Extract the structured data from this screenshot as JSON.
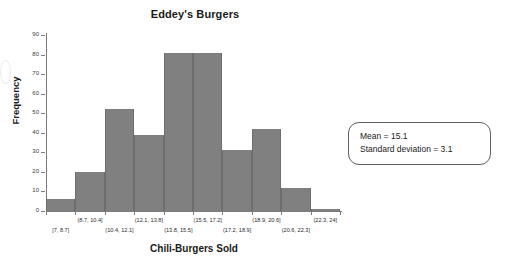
{
  "chart_data": {
    "type": "bar",
    "title": "Eddey's Burgers",
    "xlabel": "Chili-Burgers Sold",
    "ylabel": "Frequency",
    "categories": [
      "[7, 8.7]",
      "(8.7, 10.4]",
      "(10.4, 12.1]",
      "(12.1, 13.8]",
      "(13.8, 15.5]",
      "(15.5, 17.2]",
      "(17.2, 18.9]",
      "(18.9, 20.6]",
      "(20.6, 22.3]",
      "(22.3, 24]"
    ],
    "values": [
      6,
      20,
      52,
      39,
      81,
      81,
      31,
      42,
      12,
      1
    ],
    "ylim": [
      0,
      90
    ],
    "yticks": [
      0,
      10,
      20,
      30,
      40,
      50,
      60,
      70,
      80,
      90
    ],
    "ytick_labels": [
      "0",
      "10",
      "20",
      "30",
      "40",
      "50",
      "60",
      "70",
      "80",
      "90"
    ],
    "grid": false,
    "legend": "none",
    "bar_color": "#808080",
    "axis_color": "#7b7b7b"
  },
  "annotations": {
    "stats_box": {
      "mean_line": "Mean  =  15.1",
      "sd_line": "Standard deviation  =  3.1"
    }
  }
}
